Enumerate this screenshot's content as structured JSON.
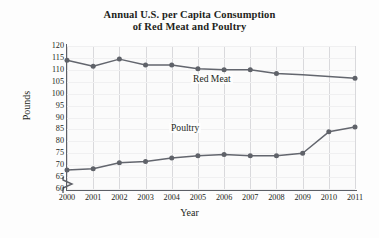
{
  "chart_data": {
    "type": "line",
    "title": "Annual U.S. per Capita Consumption of Red Meat and Poultry",
    "title_line1": "Annual U.S. per Capita Consumption",
    "title_line2": "of Red Meat and Poultry",
    "xlabel": "Year",
    "ylabel": "Pounds",
    "x": [
      2000,
      2001,
      2002,
      2003,
      2004,
      2005,
      2006,
      2007,
      2008,
      2009,
      2010,
      2011
    ],
    "xtick_labels": [
      "2000",
      "2001",
      "2002",
      "2003",
      "2004",
      "2005",
      "2006",
      "2007",
      "2008",
      "2009",
      "2010",
      "2011"
    ],
    "ytick_labels": [
      "120",
      "115",
      "110",
      "105",
      "100",
      "95",
      "90",
      "85",
      "80",
      "75",
      "70",
      "65",
      "60"
    ],
    "ylim": [
      60,
      120
    ],
    "ytick_step": 5,
    "xlim": [
      2000,
      2011
    ],
    "axis_break": true,
    "axis_break_note": "y-axis broken below 60",
    "grid": "vertical",
    "legend_position": "inline-labels",
    "series": [
      {
        "name": "Red Meat",
        "color": "#63666e",
        "values": [
          114,
          111.5,
          114.5,
          112,
          112,
          110.5,
          110,
          110,
          108.5,
          107.9,
          107.2,
          106.5
        ]
      },
      {
        "name": "Poultry",
        "color": "#63666e",
        "values": [
          68,
          68.5,
          71,
          71.5,
          73,
          74,
          74.5,
          74,
          74,
          75,
          84,
          86
        ]
      }
    ]
  },
  "figure": {
    "line_color": "#63666e",
    "marker_color": "#5f6269",
    "axis_color": "#5c5f66",
    "grid_color": "#d9d9dc",
    "background": "#fdfdfd"
  }
}
